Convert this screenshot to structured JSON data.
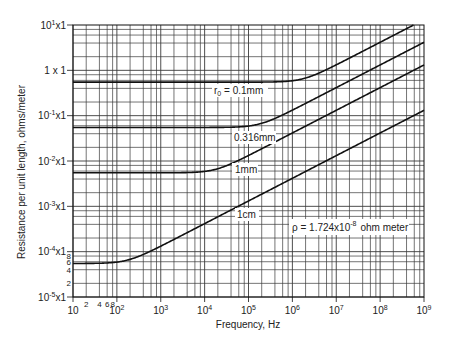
{
  "chart_data": {
    "type": "line",
    "title": "",
    "xlabel": "Frequency, Hz",
    "ylabel": "Resistance per unit length, ohms/meter",
    "xscale": "log",
    "yscale": "log",
    "xlim": [
      10,
      1000000000
    ],
    "ylim": [
      1e-05,
      10
    ],
    "grid": true,
    "x_tick_labels": [
      "10",
      "10^2",
      "10^3",
      "10^4",
      "10^5",
      "10^6",
      "10^7",
      "10^8",
      "10^9"
    ],
    "x_minor_tick_labels": [
      "2",
      "4",
      "6",
      "8"
    ],
    "y_tick_labels": [
      "10^1x1",
      "1 x 1",
      "10^-1x1",
      "10^-2x1",
      "10^-3x1",
      "10^-4x1",
      "10^-5x1"
    ],
    "y_minor_tick_labels": [
      "8",
      "6",
      "4",
      "2"
    ],
    "resistivity_ohm_meter": 1.724e-08,
    "annotation": "ρ = 1.724x10^-8 ohm meter",
    "series": [
      {
        "name": "r0 = 0.1mm",
        "label": "r₀ = 0.1mm",
        "radius_m": 0.0001,
        "dc_resistance": 0.549,
        "points": [
          [
            10,
            0.549
          ],
          [
            100000,
            0.55
          ],
          [
            1000000,
            0.85
          ],
          [
            10000000,
            2.3
          ],
          [
            100000000,
            4.2
          ],
          [
            582000000,
            10
          ]
        ]
      },
      {
        "name": "0.316mm",
        "label": "0.316mm",
        "radius_m": 0.000316,
        "dc_resistance": 0.055,
        "points": [
          [
            10,
            0.055
          ],
          [
            10000,
            0.055
          ],
          [
            100000,
            0.075
          ],
          [
            1000000,
            0.21
          ],
          [
            10000000,
            0.66
          ],
          [
            100000000,
            2.1
          ],
          [
            1000000000,
            6.6
          ]
        ]
      },
      {
        "name": "1mm",
        "label": "1mm",
        "radius_m": 0.001,
        "dc_resistance": 0.00549,
        "points": [
          [
            10,
            0.00549
          ],
          [
            1000,
            0.00549
          ],
          [
            10000,
            0.0062
          ],
          [
            100000,
            0.0168
          ],
          [
            1000000,
            0.0524
          ],
          [
            10000000,
            0.166
          ],
          [
            100000000,
            0.524
          ],
          [
            1000000000,
            1.66
          ]
        ]
      },
      {
        "name": "1cm",
        "label": "1cm",
        "radius_m": 0.01,
        "dc_resistance": 5.49e-05,
        "points": [
          [
            10,
            5.49e-05
          ],
          [
            100,
            6.2e-05
          ],
          [
            1000,
            0.000136
          ],
          [
            10000,
            0.000416
          ],
          [
            100000,
            0.00131
          ],
          [
            1000000,
            0.00415
          ],
          [
            10000000,
            0.0131
          ],
          [
            100000000,
            0.0415
          ],
          [
            1000000000,
            0.131
          ]
        ]
      }
    ],
    "legend_position": "inline labels"
  },
  "labels": {
    "ylabel": "Resistance per unit length, ohms/meter",
    "xlabel": "Frequency, Hz",
    "annotation_rho": "ρ = 1.724x10",
    "annotation_exp": "-8",
    "annotation_unit": "ohm meter",
    "curve_r0": "r",
    "curve_r0_sub": "0",
    "curve_r0_value": " = 0.1mm",
    "curve_2": "0.316mm",
    "curve_3": "1mm",
    "curve_4": "1cm"
  },
  "colors": {
    "grid": "#3a3a3a",
    "curve": "#111111",
    "background": "#ffffff"
  }
}
